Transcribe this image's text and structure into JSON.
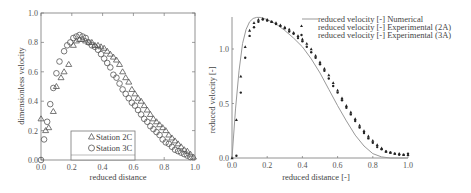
{
  "chart_data": [
    {
      "type": "scatter",
      "xlabel": "reduced distance",
      "ylabel": "dimensionless velocity",
      "xlim": [
        0,
        1
      ],
      "ylim": [
        0,
        1
      ],
      "xticks": [
        "0.0",
        "0.2",
        "0.4",
        "0.6",
        "0.8",
        "1.0"
      ],
      "yticks": [
        "0.0",
        "0.2",
        "0.4",
        "0.6",
        "0.8",
        "1.0"
      ],
      "legend_position": "lower-left",
      "series": [
        {
          "name": "Station 2C",
          "marker": "triangle",
          "x": [
            0.0,
            0.03,
            0.05,
            0.08,
            0.1,
            0.13,
            0.15,
            0.18,
            0.21,
            0.23,
            0.25,
            0.27,
            0.29,
            0.31,
            0.33,
            0.35,
            0.37,
            0.39,
            0.41,
            0.43,
            0.45,
            0.47,
            0.49,
            0.51,
            0.53,
            0.55,
            0.57,
            0.59,
            0.61,
            0.63,
            0.65,
            0.67,
            0.69,
            0.71,
            0.73,
            0.75,
            0.77,
            0.79,
            0.81,
            0.83,
            0.85,
            0.87,
            0.89,
            0.91,
            0.93,
            0.95,
            0.97,
            0.99
          ],
          "y": [
            0.28,
            0.2,
            0.22,
            0.33,
            0.5,
            0.56,
            0.6,
            0.65,
            0.78,
            0.81,
            0.82,
            0.82,
            0.81,
            0.8,
            0.8,
            0.78,
            0.78,
            0.77,
            0.76,
            0.74,
            0.72,
            0.7,
            0.68,
            0.65,
            0.6,
            0.56,
            0.53,
            0.48,
            0.45,
            0.42,
            0.4,
            0.37,
            0.34,
            0.31,
            0.28,
            0.26,
            0.24,
            0.22,
            0.2,
            0.17,
            0.15,
            0.13,
            0.11,
            0.09,
            0.07,
            0.06,
            0.04,
            0.02
          ]
        },
        {
          "name": "Station 3C",
          "marker": "circle",
          "x": [
            0.0,
            0.02,
            0.04,
            0.06,
            0.08,
            0.1,
            0.12,
            0.15,
            0.17,
            0.19,
            0.21,
            0.23,
            0.25,
            0.27,
            0.29,
            0.31,
            0.33,
            0.35,
            0.37,
            0.39,
            0.41,
            0.43,
            0.45,
            0.47,
            0.49,
            0.51,
            0.53,
            0.55,
            0.57,
            0.59,
            0.61,
            0.63,
            0.65,
            0.67,
            0.69,
            0.71,
            0.73,
            0.75,
            0.77,
            0.79,
            0.81,
            0.83,
            0.85,
            0.87,
            0.89,
            0.91,
            0.93,
            0.95,
            0.97
          ],
          "y": [
            0.0,
            0.14,
            0.26,
            0.38,
            0.49,
            0.59,
            0.67,
            0.74,
            0.78,
            0.8,
            0.83,
            0.84,
            0.85,
            0.84,
            0.83,
            0.8,
            0.78,
            0.77,
            0.75,
            0.72,
            0.69,
            0.66,
            0.63,
            0.58,
            0.56,
            0.52,
            0.48,
            0.45,
            0.42,
            0.39,
            0.37,
            0.34,
            0.31,
            0.28,
            0.26,
            0.23,
            0.21,
            0.19,
            0.17,
            0.14,
            0.12,
            0.11,
            0.09,
            0.07,
            0.06,
            0.05,
            0.04,
            0.03,
            0.02
          ]
        }
      ]
    },
    {
      "type": "line+scatter",
      "xlabel": "reduced distance [-]",
      "ylabel": "reduced velocity [-]",
      "xlim": [
        0,
        1
      ],
      "ylim": [
        0,
        1.3
      ],
      "xticks": [
        "0.0",
        "0.2",
        "0.4",
        "0.6",
        "0.8",
        "1.0"
      ],
      "yticks": [
        "0.0",
        "0.5",
        "1.0"
      ],
      "legend_position": "upper-right",
      "series": [
        {
          "name": "reduced velocity [-] Numerical",
          "marker": "line",
          "x": [
            0.0,
            0.02,
            0.04,
            0.06,
            0.08,
            0.1,
            0.12,
            0.14,
            0.16,
            0.2,
            0.25,
            0.3,
            0.35,
            0.4,
            0.45,
            0.5,
            0.55,
            0.6,
            0.65,
            0.7,
            0.75,
            0.8,
            0.85,
            0.9,
            0.95,
            1.0
          ],
          "y": [
            0.0,
            0.45,
            0.8,
            1.05,
            1.18,
            1.25,
            1.28,
            1.29,
            1.29,
            1.27,
            1.23,
            1.17,
            1.1,
            1.02,
            0.91,
            0.78,
            0.63,
            0.48,
            0.34,
            0.21,
            0.11,
            0.04,
            0.01,
            0.0,
            0.0,
            0.0
          ]
        },
        {
          "name": "reduced velocity [-] Experimental (2A)",
          "marker": "triangle",
          "x": [
            0.0,
            0.025,
            0.05,
            0.075,
            0.1,
            0.125,
            0.15,
            0.175,
            0.2,
            0.225,
            0.25,
            0.275,
            0.3,
            0.325,
            0.35,
            0.375,
            0.4,
            0.425,
            0.45,
            0.475,
            0.5,
            0.525,
            0.55,
            0.575,
            0.6,
            0.625,
            0.65,
            0.675,
            0.7,
            0.725,
            0.75,
            0.775,
            0.8,
            0.825,
            0.85,
            0.875,
            0.9,
            0.925,
            0.95,
            0.975,
            1.0
          ],
          "y": [
            0.0,
            0.35,
            0.75,
            1.02,
            1.17,
            1.24,
            1.27,
            1.28,
            1.27,
            1.25,
            1.24,
            1.22,
            1.2,
            1.18,
            1.15,
            1.12,
            1.09,
            1.05,
            1.0,
            0.94,
            0.88,
            0.82,
            0.76,
            0.69,
            0.62,
            0.55,
            0.48,
            0.42,
            0.36,
            0.3,
            0.25,
            0.2,
            0.16,
            0.12,
            0.09,
            0.06,
            0.05,
            0.04,
            0.04,
            0.03,
            0.03
          ]
        },
        {
          "name": "reduced velocity [-] Experimental (3A)",
          "marker": "dot",
          "x": [
            0.025,
            0.05,
            0.075,
            0.1,
            0.125,
            0.15,
            0.175,
            0.2,
            0.225,
            0.25,
            0.275,
            0.3,
            0.325,
            0.35,
            0.375,
            0.4,
            0.425,
            0.45,
            0.475,
            0.5,
            0.525,
            0.55,
            0.575,
            0.6,
            0.625,
            0.65,
            0.675,
            0.7,
            0.725,
            0.75,
            0.775,
            0.8,
            0.825,
            0.85,
            0.875,
            0.9,
            0.925,
            0.95,
            0.975,
            1.0
          ],
          "y": [
            0.02,
            0.6,
            0.92,
            1.12,
            1.2,
            1.25,
            1.27,
            1.26,
            1.25,
            1.23,
            1.21,
            1.19,
            1.16,
            1.14,
            1.1,
            1.07,
            1.02,
            0.97,
            0.92,
            0.86,
            0.8,
            0.73,
            0.66,
            0.6,
            0.53,
            0.46,
            0.4,
            0.34,
            0.28,
            0.23,
            0.18,
            0.14,
            0.1,
            0.08,
            0.06,
            0.05,
            0.04,
            0.03,
            0.03,
            0.04
          ]
        }
      ]
    }
  ]
}
